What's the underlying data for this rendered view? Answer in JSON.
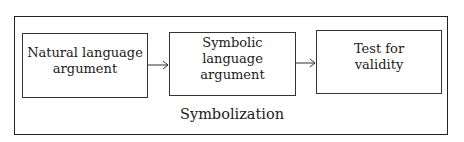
{
  "diagram": {
    "type": "flowchart",
    "container_label": "Symbolization",
    "boxes": [
      {
        "id": "b1",
        "line1": "Natural language",
        "line2": "argument"
      },
      {
        "id": "b2",
        "line1": "Symbolic language",
        "line2": "argument"
      },
      {
        "id": "b3",
        "line1": "Test for",
        "line2": "validity"
      }
    ],
    "edges": [
      {
        "from": "b1",
        "to": "b2"
      },
      {
        "from": "b2",
        "to": "b3"
      }
    ],
    "colors": {
      "stroke": "#222222",
      "background": "#ffffff",
      "text": "#1a1a1a"
    }
  }
}
